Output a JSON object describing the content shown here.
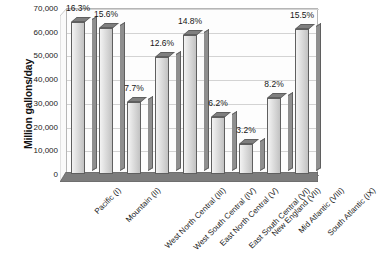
{
  "chart_data": {
    "type": "bar",
    "title": "",
    "xlabel": "",
    "ylabel": "Million gallons/day",
    "ylim": [
      0,
      70000
    ],
    "ytick_step": 10000,
    "grid": true,
    "legend": "none",
    "style": "3d-column",
    "categories": [
      "Pacific (I)",
      "Mountain (II)",
      "West North Central (III)",
      "West South Central (IV)",
      "East North Central (V)",
      "East South Central (VI)",
      "New England (VII)",
      "Mid Atlantic (VIII)",
      "South Atlantic (IX)"
    ],
    "values": [
      64000,
      61500,
      30500,
      49500,
      58500,
      24000,
      12500,
      32000,
      61000
    ],
    "data_labels": [
      "16.3%",
      "15.6%",
      "7.7%",
      "12.6%",
      "14.8%",
      "6.2%",
      "3.2%",
      "8.2%",
      "15.5%"
    ],
    "percentages": [
      16.3,
      15.6,
      7.7,
      12.6,
      14.8,
      6.2,
      3.2,
      8.2,
      15.5
    ],
    "ytick_labels": [
      "0",
      "10,000",
      "20,000",
      "30,000",
      "40,000",
      "50,000",
      "60,000",
      "70,000"
    ],
    "ytick_values": [
      0,
      10000,
      20000,
      30000,
      40000,
      50000,
      60000,
      70000
    ],
    "colors": {
      "bar_face": "#e0e0e0",
      "bar_side": "#8f8f8f",
      "bar_top": "#7f7f7f",
      "bar_outline": "#5f5f5f",
      "plot_background": "#fdfdfd",
      "floor": "#7c7c7c",
      "gridline": "#d3d3d3",
      "text": "#1a1a1a"
    }
  }
}
